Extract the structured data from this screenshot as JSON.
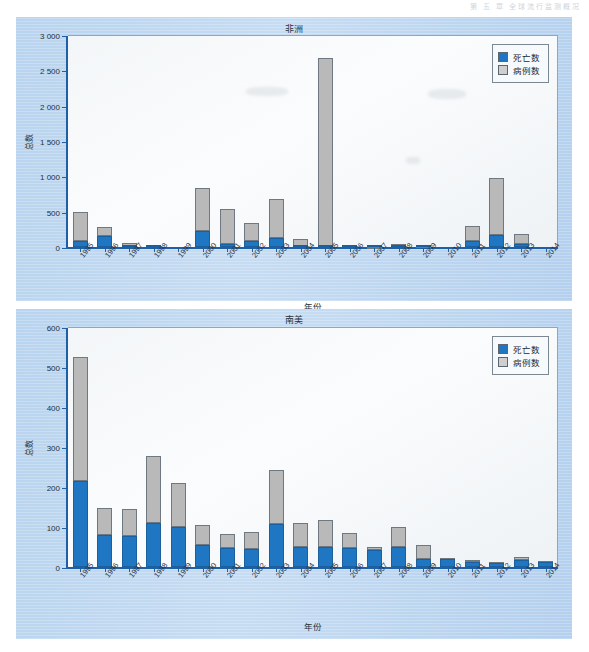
{
  "running_head": "第 五 章  全球流行监测概况",
  "colors": {
    "deaths": "#1f76c2",
    "cases": "#b9b9b9",
    "panel_blue": "#c0d8f0",
    "axis": "#1f5fa8"
  },
  "legend": {
    "deaths_label": "死亡数",
    "cases_label": "病例数"
  },
  "chart_data": [
    {
      "type": "bar",
      "id": "africa",
      "title": "非洲",
      "xlabel": "年份",
      "ylabel": "总数",
      "ylim": [
        0,
        3000
      ],
      "yticks": [
        0,
        500,
        1000,
        1500,
        2000,
        2500,
        3000
      ],
      "ytick_labels": [
        "0",
        "500",
        "1 000",
        "1 500",
        "2 000",
        "2 500",
        "3 000"
      ],
      "grid": false,
      "legend_position": "top-right",
      "stacked": true,
      "categories": [
        "1995",
        "1996",
        "1997",
        "1998",
        "1999",
        "2000",
        "2001",
        "2002",
        "2003",
        "2004",
        "2005",
        "2006",
        "2007",
        "2008",
        "2009",
        "2010",
        "2011",
        "2012",
        "2013",
        "2014"
      ],
      "series": [
        {
          "name": "死亡数",
          "values": [
            80,
            160,
            15,
            8,
            0,
            225,
            45,
            85,
            130,
            5,
            10,
            5,
            2,
            5,
            2,
            0,
            80,
            175,
            45,
            0
          ]
        },
        {
          "name": "病例数",
          "values": [
            410,
            125,
            35,
            22,
            0,
            615,
            500,
            250,
            550,
            115,
            2670,
            25,
            5,
            40,
            10,
            0,
            220,
            795,
            145,
            0
          ]
        }
      ],
      "totals": [
        490,
        285,
        50,
        30,
        0,
        840,
        545,
        335,
        680,
        120,
        2680,
        30,
        7,
        45,
        12,
        0,
        300,
        970,
        190,
        0
      ]
    },
    {
      "type": "bar",
      "id": "south-america",
      "title": "南美",
      "xlabel": "年份",
      "ylabel": "总数",
      "ylim": [
        0,
        600
      ],
      "yticks": [
        0,
        100,
        200,
        300,
        400,
        500,
        600
      ],
      "ytick_labels": [
        "0",
        "100",
        "200",
        "300",
        "400",
        "500",
        "600"
      ],
      "grid": false,
      "legend_position": "top-right",
      "stacked": true,
      "categories": [
        "1995",
        "1996",
        "1997",
        "1998",
        "1999",
        "2000",
        "2001",
        "2002",
        "2003",
        "2004",
        "2005",
        "2006",
        "2007",
        "2008",
        "2009",
        "2010",
        "2011",
        "2012",
        "2013",
        "2014"
      ],
      "series": [
        {
          "name": "死亡数",
          "values": [
            216,
            80,
            78,
            111,
            101,
            54,
            47,
            45,
            107,
            50,
            49,
            48,
            42,
            49,
            19,
            20,
            13,
            11,
            17,
            12
          ]
        },
        {
          "name": "病例数",
          "values": [
            309,
            68,
            68,
            167,
            110,
            51,
            36,
            42,
            136,
            60,
            68,
            37,
            7,
            52,
            37,
            2,
            5,
            2,
            7,
            3
          ]
        }
      ],
      "totals": [
        525,
        148,
        146,
        278,
        211,
        105,
        83,
        87,
        243,
        110,
        117,
        85,
        49,
        101,
        56,
        22,
        18,
        13,
        24,
        15
      ]
    }
  ]
}
